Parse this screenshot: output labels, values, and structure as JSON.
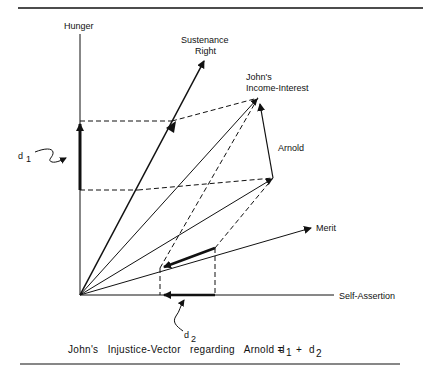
{
  "figure": {
    "axes": {
      "y_label": "Hunger",
      "x_label": "Self-Assertion"
    },
    "vectors": [
      {
        "name": "sustenance-right",
        "label_line1": "Sustenance",
        "label_line2": "Right"
      },
      {
        "name": "johns-income-interest",
        "label_line1": "John's",
        "label_line2": "Income-Interest"
      },
      {
        "name": "arnold",
        "label": "Arnold"
      },
      {
        "name": "merit",
        "label": "Merit"
      }
    ],
    "annotations": {
      "d1": {
        "letter": "d",
        "sub": "1"
      },
      "d2": {
        "letter": "d",
        "sub": "2"
      }
    },
    "caption": {
      "prefix": "John's   Injustice-Vector   regarding   Arnold =",
      "d1": "d",
      "d1_sub": "1",
      "plus": "+",
      "d2": "d",
      "d2_sub": "2"
    },
    "colors": {
      "ink": "#111111",
      "background": "#ffffff"
    }
  }
}
